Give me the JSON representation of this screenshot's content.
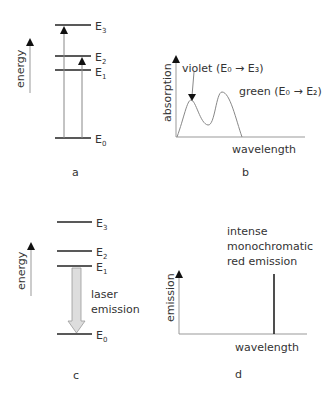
{
  "panel_a": {
    "label": "a",
    "axis_label": "energy",
    "levels": [
      {
        "name": "E",
        "sub": "3"
      },
      {
        "name": "E",
        "sub": "2"
      },
      {
        "name": "E",
        "sub": "1"
      },
      {
        "name": "E",
        "sub": "0"
      }
    ]
  },
  "panel_b": {
    "label": "b",
    "ylabel": "absorption",
    "xlabel": "wavelength",
    "annotation_violet": "violet (E₀ → E₃)",
    "annotation_green": "green (E₀ → E₂)"
  },
  "panel_c": {
    "label": "c",
    "axis_label": "energy",
    "levels": [
      {
        "name": "E",
        "sub": "3"
      },
      {
        "name": "E",
        "sub": "2"
      },
      {
        "name": "E",
        "sub": "1"
      },
      {
        "name": "E",
        "sub": "0"
      }
    ],
    "arrow_label_line1": "laser",
    "arrow_label_line2": "emission"
  },
  "panel_d": {
    "label": "d",
    "ylabel": "emission",
    "xlabel": "wavelength",
    "annotation_line1": "intense",
    "annotation_line2": "monochromatic",
    "annotation_line3": "red emission"
  }
}
